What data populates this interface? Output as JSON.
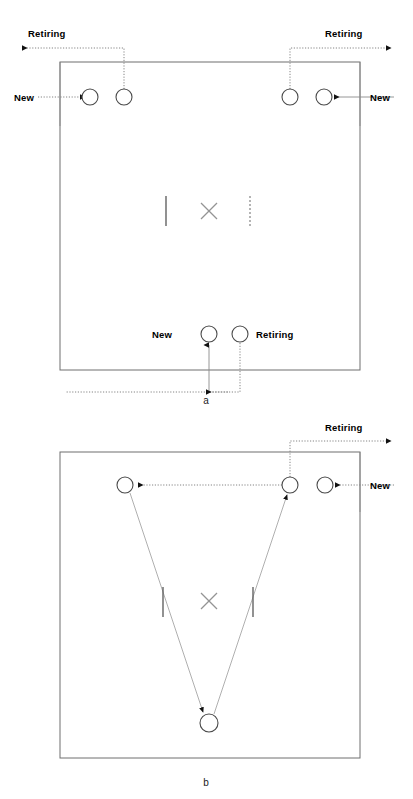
{
  "figure": {
    "colors": {
      "court_border": "#6e6e6e",
      "node_stroke": "#4a4a4a",
      "flow_line": "#777777",
      "label_text": "#000000",
      "mark": "#949494",
      "background": "#ffffff"
    },
    "panels": [
      {
        "id": "a",
        "caption": "a",
        "court": {
          "x": 60,
          "y": 62,
          "width": 300,
          "height": 308
        },
        "center_marks": {
          "tick_left": {
            "x": 166,
            "y_top": 196,
            "y_bottom": 226,
            "style": "solid"
          },
          "tick_right": {
            "x": 250,
            "y_top": 196,
            "y_bottom": 226,
            "style": "dotted"
          },
          "cross": {
            "cx": 209,
            "cy": 211,
            "size": 12
          }
        },
        "nodes": [
          {
            "id": "a-top-left-new",
            "cx": 90,
            "cy": 97,
            "r": 8,
            "label": "New",
            "label_side": "left"
          },
          {
            "id": "a-top-left-retiring",
            "cx": 124,
            "cy": 97,
            "r": 8,
            "label": "Retiring",
            "label_side": "up-left"
          },
          {
            "id": "a-top-right-retiring",
            "cx": 290,
            "cy": 97,
            "r": 8,
            "label": "Retiring",
            "label_side": "up-right"
          },
          {
            "id": "a-top-right-new",
            "cx": 324,
            "cy": 97,
            "r": 8,
            "label": "New",
            "label_side": "right"
          },
          {
            "id": "a-bottom-new",
            "cx": 209,
            "cy": 334,
            "r": 8,
            "label": "New",
            "label_side": "left"
          },
          {
            "id": "a-bottom-retiring",
            "cx": 240,
            "cy": 334,
            "r": 8,
            "label": "Retiring",
            "label_side": "right"
          }
        ],
        "labels": [
          {
            "text": "Retiring",
            "x": 28,
            "y": 37
          },
          {
            "text": "Retiring",
            "x": 325,
            "y": 37
          },
          {
            "text": "New",
            "x": 18,
            "y": 100
          },
          {
            "text": "New",
            "x": 367,
            "y": 100
          },
          {
            "text": "New",
            "x": 155,
            "y": 338
          },
          {
            "text": "Retiring",
            "x": 258,
            "y": 338
          }
        ]
      },
      {
        "id": "b",
        "caption": "b",
        "court": {
          "x": 60,
          "y": 452,
          "width": 300,
          "height": 306
        },
        "center_marks": {
          "tick_left": {
            "x": 163,
            "y_top": 587,
            "y_bottom": 617,
            "style": "solid"
          },
          "tick_right": {
            "x": 253,
            "y_top": 587,
            "y_bottom": 617,
            "style": "solid"
          },
          "cross": {
            "cx": 209,
            "cy": 601,
            "size": 12
          }
        },
        "nodes": [
          {
            "id": "b-top-left",
            "cx": 125,
            "cy": 485,
            "r": 8,
            "label": "",
            "label_side": "none"
          },
          {
            "id": "b-top-right-retiring",
            "cx": 290,
            "cy": 485,
            "r": 8,
            "label": "Retiring",
            "label_side": "up-right"
          },
          {
            "id": "b-top-far-right-new",
            "cx": 325,
            "cy": 485,
            "r": 8,
            "label": "New",
            "label_side": "right"
          },
          {
            "id": "b-bottom-center",
            "cx": 209,
            "cy": 723,
            "r": 9,
            "label": "",
            "label_side": "none"
          }
        ],
        "labels": [
          {
            "text": "Retiring",
            "x": 325,
            "y": 427
          },
          {
            "text": "New",
            "x": 367,
            "y": 488
          }
        ]
      }
    ]
  }
}
